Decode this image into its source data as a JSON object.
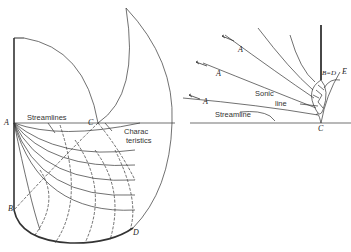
{
  "left_diagram": {
    "points": {
      "A": "A",
      "B": "B",
      "C": "C",
      "D": "D"
    },
    "labels": {
      "streamlines": "Streamlines",
      "characteristics_1": "Charac",
      "characteristics_2": "teristics"
    }
  },
  "right_diagram": {
    "points": {
      "BD": "B=D",
      "E": "E",
      "C": "C"
    },
    "arrows": [
      "A",
      "A",
      "A"
    ],
    "labels": {
      "sonic_1": "Sonic",
      "sonic_2": "line",
      "streamline": "Streamline"
    }
  },
  "colors": {
    "line": "#333333",
    "background": "#ffffff"
  }
}
